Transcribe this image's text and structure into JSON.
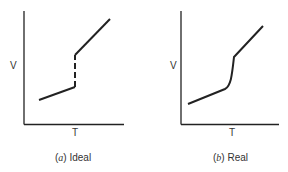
{
  "panels": [
    {
      "id": "a",
      "caption_letter": "a",
      "caption_text": "Ideal",
      "ylabel": "V",
      "xlabel": "T"
    },
    {
      "id": "b",
      "caption_letter": "b",
      "caption_text": "Real",
      "ylabel": "V",
      "xlabel": "T"
    }
  ],
  "colors": {
    "line": "#222222"
  }
}
